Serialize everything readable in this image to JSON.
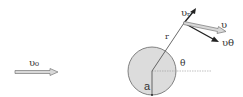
{
  "diagram": {
    "labels": {
      "incoming_velocity": "υ₀",
      "radial_velocity": "υᵣ",
      "velocity": "υ",
      "tangential_velocity": "υθ",
      "radius_vector": "r",
      "angle": "θ",
      "sphere_radius": "a"
    },
    "colors": {
      "sphere_fill": "#dcdcdc",
      "sphere_stroke": "#666666",
      "line": "#444444",
      "dark_arrow": "#222222",
      "hollow_arrow_fill": "#d8d8d8",
      "hollow_arrow_stroke": "#777777",
      "dotted_line": "#999999"
    }
  }
}
